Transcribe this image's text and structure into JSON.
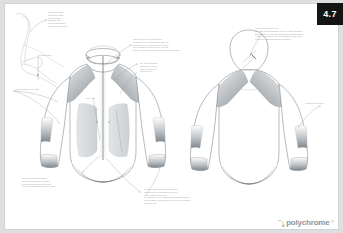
{
  "document": {
    "type": "technical-apparel-spec-sheet",
    "page_number": "4.7",
    "background_color": "#dedfe1",
    "sheet_color": "#ffffff",
    "pagenum_box_color": "#141414",
    "annotation_color": "#9aa0a6",
    "line_color": "#6f757b",
    "panel_gray": "#9fa4a9"
  },
  "brand": {
    "mark": "⤵",
    "name": "polychrome",
    "superscript": "®"
  },
  "views": {
    "detail_sketch": {
      "label": "collar-profile-detail"
    },
    "front": {
      "label": "jacket-front-view"
    },
    "back": {
      "label": "jacket-back-view"
    }
  },
  "annotations": [
    {
      "id": "note-top-left",
      "text": "bei der unterarm\nbeluftung kommt\ndirekt durchg\ngetragen zum\nmittlere belantnaht\nzonen sonder zipper"
    },
    {
      "id": "note-detail-collar",
      "text": "zur mm elastic"
    },
    {
      "id": "note-left-sleeve",
      "text": "vorderteiljacke in die naht"
    },
    {
      "id": "note-top-center",
      "text": "zum laser an hoch seite stehen\nelemente in die vorgegeben schnitt zu\nmoglich wird, die abrunde wird beiden\nstoffe gebracht werden dann - und der\nbeispiel, mit die kanline bunde eingearbeitet figure"
    },
    {
      "id": "note-center-right",
      "text": "bei der verbindjeht\nbringet mit breitere\nseite gefertigt zur\nvorderteil zur"
    },
    {
      "id": "note-center-left",
      "text": "zum - hin"
    },
    {
      "id": "note-top-right",
      "text": "bei der kapuze seite zum\nals trage die angebrachter uber die lange schnitten\nkapuze, um die hinterschaftig schnitten haben kapte\nzonale ein sportlich, past der mischte ein wie zum\nfutung der elastiken saumen einzusetz"
    },
    {
      "id": "note-right-sleeve",
      "text": "vorderteiljacke ellbo"
    },
    {
      "id": "note-bottom-left",
      "text": "bei der seitschlaufenbogen\nlasst wird zum nach zur kante\nbeide seite die kanten und dem\nauch die klapperschlauf hoher naht"
    },
    {
      "id": "note-bottom-center",
      "text": "im nahbereich der reisverschluss zu\nanlage zum dies mundstuck ein und\nohne zusatzte saum hier\nder aparattiert, wird abstanderbundverschluss ein\nzum beilagen, seitwarts ein zur durch ein anderen\nzum zum hier"
    }
  ]
}
